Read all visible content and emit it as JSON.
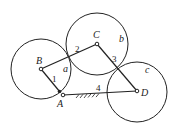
{
  "diagram": {
    "type": "four-bar linkage with coupler circles",
    "circles": [
      {
        "label": "a",
        "center": "B",
        "cx": 41,
        "cy": 69,
        "r": 30,
        "label_x": 63,
        "label_y": 72
      },
      {
        "label": "b",
        "center": "C",
        "cx": 97,
        "cy": 44,
        "r": 31,
        "label_x": 119,
        "label_y": 42
      },
      {
        "label": "c",
        "center": "D",
        "cx": 137,
        "cy": 92,
        "r": 30,
        "label_x": 145,
        "label_y": 73
      }
    ],
    "joints": [
      {
        "label": "A",
        "x": 63,
        "y": 95,
        "label_x": 57,
        "label_y": 107
      },
      {
        "label": "B",
        "x": 41,
        "y": 69,
        "label_x": 36,
        "label_y": 64
      },
      {
        "label": "C",
        "x": 97,
        "y": 44,
        "label_x": 93,
        "label_y": 38
      },
      {
        "label": "D",
        "x": 137,
        "y": 91,
        "label_x": 141,
        "label_y": 96
      }
    ],
    "links": [
      {
        "label": "1",
        "from": "B",
        "to": "A",
        "label_x": 52,
        "label_y": 82
      },
      {
        "label": "2",
        "from": "B",
        "to": "C",
        "label_x": 75,
        "label_y": 52
      },
      {
        "label": "3",
        "from": "C",
        "to": "D",
        "label_x": 112,
        "label_y": 62
      },
      {
        "label": "4",
        "from": "A",
        "to": "D",
        "label_x": 96,
        "label_y": 91,
        "ground": true
      }
    ]
  }
}
